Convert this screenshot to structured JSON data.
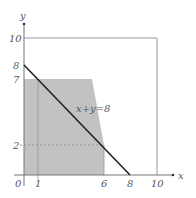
{
  "diagram": {
    "axes": {
      "x_label": "x",
      "y_label": "y",
      "origin_label": "0",
      "x_ticks": [
        "1",
        "6",
        "8",
        "10"
      ],
      "y_ticks": [
        "2",
        "7",
        "8",
        "10"
      ]
    },
    "line_label": "x+y=8",
    "colors": {
      "shade": "#bdbdbd",
      "line": "#222222",
      "axis": "#777777",
      "frame": "#999999"
    }
  }
}
